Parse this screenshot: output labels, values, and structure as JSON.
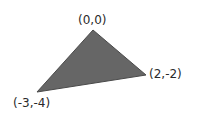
{
  "diagram": {
    "type": "triangle",
    "fill_color": "#666666",
    "stroke_color": "#4a4a4a",
    "vertices": [
      {
        "label": "(0,0)",
        "x": 0,
        "y": 0,
        "px": 93,
        "py": 30
      },
      {
        "label": "(2,-2)",
        "x": 2,
        "y": -2,
        "px": 146,
        "py": 75
      },
      {
        "label": "(-3,-4)",
        "x": -3,
        "y": -4,
        "px": 37,
        "py": 92
      }
    ]
  }
}
